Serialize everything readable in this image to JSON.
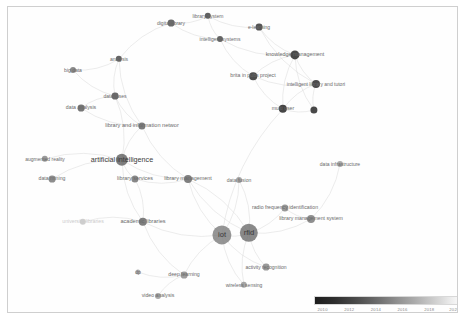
{
  "visualization": {
    "type": "bibliometric-network-overlay",
    "tool_style": "VOSviewer overlay visualization",
    "background": "#ffffff",
    "border_color": "#cfcfcf"
  },
  "legend": {
    "title": "",
    "orientation": "horizontal",
    "gradient_from_color": "#1d1d1d",
    "gradient_to_color": "#f6f6f6",
    "meaning": "average publication year",
    "ticks": [
      {
        "label": "2010",
        "pos": 0.06
      },
      {
        "label": "2012",
        "pos": 0.245
      },
      {
        "label": "2014",
        "pos": 0.43
      },
      {
        "label": "2016",
        "pos": 0.615
      },
      {
        "label": "2018",
        "pos": 0.8
      },
      {
        "label": "2020",
        "pos": 0.975
      }
    ]
  },
  "chart_data": {
    "type": "scatter",
    "title": "",
    "xlabel": "",
    "ylabel": "",
    "colorbar": {
      "min": 2010,
      "max": 2020,
      "label": "year"
    },
    "nodes": [
      {
        "label": "digital library",
        "x": 163,
        "y": 16,
        "r": 3.4,
        "color": "#555555",
        "fs": 5.0,
        "lx": 163,
        "ly": 16,
        "anchor": "center"
      },
      {
        "label": "library system",
        "x": 200,
        "y": 9,
        "r": 3.2,
        "color": "#4a4a4a",
        "fs": 5.0,
        "lx": 200,
        "ly": 9,
        "anchor": "center"
      },
      {
        "label": "intelligent systems",
        "x": 212,
        "y": 32,
        "r": 3.0,
        "color": "#4e4e4e",
        "fs": 5.0,
        "lx": 212,
        "ly": 32,
        "anchor": "center"
      },
      {
        "label": "e-learning",
        "x": 251,
        "y": 20,
        "r": 3.4,
        "color": "#3d3d3d",
        "fs": 5.0,
        "lx": 251,
        "ly": 20,
        "anchor": "center"
      },
      {
        "label": "knowledge management",
        "x": 287,
        "y": 48,
        "r": 4.6,
        "color": "#303030",
        "fs": 5.4,
        "lx": 287,
        "ly": 48,
        "anchor": "center"
      },
      {
        "label": "brita in pubs project",
        "x": 245,
        "y": 69,
        "r": 3.8,
        "color": "#343434",
        "fs": 5.2,
        "lx": 245,
        "ly": 69,
        "anchor": "center"
      },
      {
        "label": "intelligent library and tutori",
        "x": 308,
        "y": 77,
        "r": 4.0,
        "color": "#333333",
        "fs": 5.0,
        "lx": 308,
        "ly": 77,
        "anchor": "center"
      },
      {
        "label": "multi user",
        "x": 275,
        "y": 102,
        "r": 4.2,
        "color": "#2c2c2c",
        "fs": 5.2,
        "lx": 275,
        "ly": 102,
        "anchor": "center"
      },
      {
        "label": "",
        "x": 306,
        "y": 103,
        "r": 3.6,
        "color": "#303030",
        "fs": 5.0,
        "lx": 306,
        "ly": 103,
        "anchor": "center"
      },
      {
        "label": "analysis",
        "x": 111,
        "y": 52,
        "r": 3.2,
        "color": "#4f4f4f",
        "fs": 5.0,
        "lx": 111,
        "ly": 52,
        "anchor": "center"
      },
      {
        "label": "big data",
        "x": 65,
        "y": 63,
        "r": 3.0,
        "color": "#7a7a7a",
        "fs": 5.0,
        "lx": 65,
        "ly": 63,
        "anchor": "center"
      },
      {
        "label": "databases",
        "x": 107,
        "y": 89,
        "r": 3.4,
        "color": "#555555",
        "fs": 5.0,
        "lx": 107,
        "ly": 89,
        "anchor": "center"
      },
      {
        "label": "data analysis",
        "x": 73,
        "y": 101,
        "r": 3.4,
        "color": "#636363",
        "fs": 5.2,
        "lx": 73,
        "ly": 101,
        "anchor": "center"
      },
      {
        "label": "library and information networ",
        "x": 134,
        "y": 119,
        "r": 3.6,
        "color": "#6a6a6a",
        "fs": 5.6,
        "lx": 134,
        "ly": 119,
        "anchor": "center"
      },
      {
        "label": "augmented reality",
        "x": 37,
        "y": 152,
        "r": 3.2,
        "color": "#8d8d8d",
        "fs": 5.0,
        "lx": 37,
        "ly": 152,
        "anchor": "center"
      },
      {
        "label": "artificial intelligence",
        "x": 114,
        "y": 153,
        "r": 6.2,
        "color": "#5e5e5e",
        "fs": 7.2,
        "lx": 114,
        "ly": 153,
        "anchor": "center"
      },
      {
        "label": "data mining",
        "x": 44,
        "y": 172,
        "r": 3.4,
        "color": "#7d7d7d",
        "fs": 5.2,
        "lx": 44,
        "ly": 172,
        "anchor": "center"
      },
      {
        "label": "library services",
        "x": 127,
        "y": 172,
        "r": 3.6,
        "color": "#777777",
        "fs": 5.4,
        "lx": 127,
        "ly": 172,
        "anchor": "center"
      },
      {
        "label": "library management",
        "x": 180,
        "y": 172,
        "r": 4.0,
        "color": "#6e6e6e",
        "fs": 5.4,
        "lx": 180,
        "ly": 172,
        "anchor": "center"
      },
      {
        "label": "data fusion",
        "x": 231,
        "y": 173,
        "r": 3.0,
        "color": "#999999",
        "fs": 5.0,
        "lx": 231,
        "ly": 173,
        "anchor": "center"
      },
      {
        "label": "data infrastructure",
        "x": 332,
        "y": 157,
        "r": 3.0,
        "color": "#9e9e9e",
        "fs": 5.0,
        "lx": 332,
        "ly": 157,
        "anchor": "center"
      },
      {
        "label": "radio frequency identification",
        "x": 277,
        "y": 201,
        "r": 3.6,
        "color": "#8a8a8a",
        "fs": 5.2,
        "lx": 277,
        "ly": 201,
        "anchor": "center"
      },
      {
        "label": "library management system",
        "x": 303,
        "y": 212,
        "r": 4.0,
        "color": "#7f7f7f",
        "fs": 5.2,
        "lx": 303,
        "ly": 212,
        "anchor": "center"
      },
      {
        "label": "university libraries",
        "x": 75,
        "y": 215,
        "r": 3.2,
        "color": "#c8c8c8",
        "fs": 5.2,
        "lx": 75,
        "ly": 215,
        "anchor": "center"
      },
      {
        "label": "academic libraries",
        "x": 135,
        "y": 215,
        "r": 4.2,
        "color": "#6d6d6d",
        "fs": 5.6,
        "lx": 135,
        "ly": 215,
        "anchor": "center"
      },
      {
        "label": "iot",
        "x": 214,
        "y": 228,
        "r": 9.6,
        "color": "#7b7b7b",
        "fs": 7.6,
        "lx": 214,
        "ly": 228,
        "anchor": "center"
      },
      {
        "label": "rfid",
        "x": 241,
        "y": 226,
        "r": 9.2,
        "color": "#6b6b6b",
        "fs": 7.6,
        "lx": 241,
        "ly": 226,
        "anchor": "center"
      },
      {
        "label": "activity recognition",
        "x": 258,
        "y": 260,
        "r": 3.4,
        "color": "#8b8b8b",
        "fs": 5.0,
        "lx": 258,
        "ly": 260,
        "anchor": "center"
      },
      {
        "label": "deep learning",
        "x": 176,
        "y": 268,
        "r": 3.4,
        "color": "#8f8f8f",
        "fs": 5.2,
        "lx": 176,
        "ly": 268,
        "anchor": "center"
      },
      {
        "label": "wireless sensing",
        "x": 236,
        "y": 278,
        "r": 3.2,
        "color": "#9a9a9a",
        "fs": 5.0,
        "lx": 236,
        "ly": 278,
        "anchor": "center"
      },
      {
        "label": "dp",
        "x": 130,
        "y": 265,
        "r": 2.6,
        "color": "#a5a5a5",
        "fs": 5.0,
        "lx": 130,
        "ly": 265,
        "anchor": "center"
      },
      {
        "label": "video analysis",
        "x": 150,
        "y": 289,
        "r": 3.0,
        "color": "#9c9c9c",
        "fs": 5.2,
        "lx": 150,
        "ly": 289,
        "anchor": "center"
      }
    ],
    "edges": [
      [
        163,
        16,
        200,
        9
      ],
      [
        163,
        16,
        212,
        32
      ],
      [
        200,
        9,
        212,
        32
      ],
      [
        200,
        9,
        251,
        20
      ],
      [
        251,
        20,
        287,
        48
      ],
      [
        212,
        32,
        287,
        48
      ],
      [
        212,
        32,
        245,
        69
      ],
      [
        287,
        48,
        245,
        69
      ],
      [
        287,
        48,
        308,
        77
      ],
      [
        245,
        69,
        308,
        77
      ],
      [
        245,
        69,
        275,
        102
      ],
      [
        287,
        48,
        275,
        102
      ],
      [
        308,
        77,
        275,
        102
      ],
      [
        275,
        102,
        306,
        103
      ],
      [
        308,
        77,
        306,
        103
      ],
      [
        287,
        48,
        306,
        103
      ],
      [
        251,
        20,
        308,
        77
      ],
      [
        163,
        16,
        111,
        52
      ],
      [
        111,
        52,
        107,
        89
      ],
      [
        65,
        63,
        107,
        89
      ],
      [
        107,
        89,
        73,
        101
      ],
      [
        107,
        89,
        134,
        119
      ],
      [
        111,
        52,
        134,
        119
      ],
      [
        73,
        101,
        134,
        119
      ],
      [
        134,
        119,
        114,
        153
      ],
      [
        114,
        153,
        37,
        152
      ],
      [
        114,
        153,
        44,
        172
      ],
      [
        114,
        153,
        127,
        172
      ],
      [
        127,
        172,
        180,
        172
      ],
      [
        114,
        153,
        180,
        172
      ],
      [
        134,
        119,
        180,
        172
      ],
      [
        114,
        153,
        135,
        215
      ],
      [
        135,
        215,
        75,
        215
      ],
      [
        135,
        215,
        127,
        172
      ],
      [
        180,
        172,
        214,
        228
      ],
      [
        135,
        215,
        214,
        228
      ],
      [
        214,
        228,
        241,
        226
      ],
      [
        241,
        226,
        277,
        201
      ],
      [
        241,
        226,
        303,
        212
      ],
      [
        241,
        226,
        231,
        173
      ],
      [
        214,
        228,
        231,
        173
      ],
      [
        241,
        226,
        258,
        260
      ],
      [
        214,
        228,
        176,
        268
      ],
      [
        214,
        228,
        236,
        278
      ],
      [
        241,
        226,
        236,
        278
      ],
      [
        176,
        268,
        150,
        289
      ],
      [
        130,
        265,
        176,
        268
      ],
      [
        214,
        228,
        258,
        260
      ],
      [
        135,
        215,
        176,
        268
      ],
      [
        180,
        172,
        241,
        226
      ],
      [
        114,
        153,
        107,
        89
      ],
      [
        303,
        212,
        332,
        157
      ],
      [
        277,
        201,
        303,
        212
      ],
      [
        241,
        226,
        180,
        172
      ],
      [
        275,
        102,
        214,
        228
      ],
      [
        65,
        63,
        111,
        52
      ]
    ]
  }
}
